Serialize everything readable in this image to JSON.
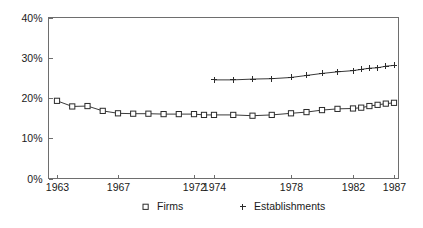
{
  "chart_data": {
    "type": "line",
    "title": "",
    "subtitle": "",
    "xlabel": "",
    "ylabel": "",
    "ylim": [
      0,
      40
    ],
    "xlim": [
      1963,
      1987
    ],
    "grid": false,
    "legend_position": "bottom",
    "y_ticks": [
      0,
      10,
      20,
      30,
      40
    ],
    "y_tick_labels": [
      "0%",
      "10%",
      "20%",
      "30%",
      "40%"
    ],
    "x_ticks": [
      1963,
      1967,
      1972,
      1974,
      1978,
      1982,
      1987
    ],
    "x_tick_labels": [
      "1963",
      "1967",
      "1972",
      "1974",
      "1978",
      "1982",
      "1987"
    ],
    "series": [
      {
        "name": "Firms",
        "marker": "square",
        "x": [
          1963,
          1964,
          1965,
          1966,
          1967,
          1968,
          1969,
          1970,
          1971,
          1972,
          1973,
          1974,
          1975,
          1976,
          1977,
          1978,
          1979,
          1980,
          1981,
          1982,
          1983,
          1984,
          1985,
          1986,
          1987
        ],
        "values": [
          19.3,
          17.9,
          18.0,
          16.8,
          16.2,
          16.1,
          16.1,
          16.0,
          16.0,
          16.0,
          15.8,
          15.8,
          15.8,
          15.6,
          15.8,
          16.2,
          16.5,
          17.0,
          17.3,
          17.4,
          17.6,
          18.0,
          18.3,
          18.6,
          18.8
        ]
      },
      {
        "name": "Establishments",
        "marker": "plus",
        "x": [
          1974,
          1975,
          1976,
          1977,
          1978,
          1979,
          1980,
          1981,
          1982,
          1983,
          1984,
          1985,
          1986,
          1987
        ],
        "values": [
          24.5,
          24.5,
          24.7,
          24.8,
          25.1,
          25.6,
          26.1,
          26.5,
          26.8,
          27.1,
          27.4,
          27.5,
          27.9,
          28.1
        ]
      }
    ],
    "legend": [
      {
        "label": "Firms",
        "marker": "square"
      },
      {
        "label": "Establishments",
        "marker": "plus"
      }
    ],
    "colors": {
      "axis": "#6e6e6e",
      "line": "#3a3a3a",
      "marker_stroke": "#2b2b2b",
      "marker_fill": "#ffffff",
      "text": "#1a1a1a",
      "background": "#ffffff"
    }
  }
}
